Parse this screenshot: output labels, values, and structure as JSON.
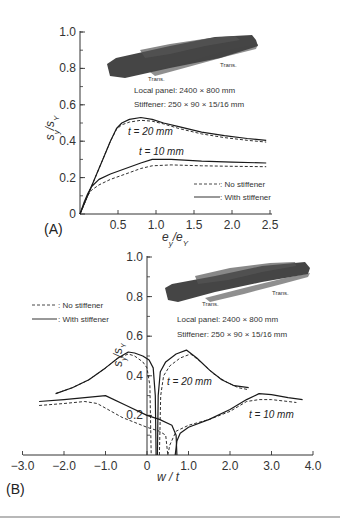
{
  "chart_data": [
    {
      "panel": "(A)",
      "type": "line",
      "title": "",
      "xlabel": "e_y/e_Y",
      "ylabel": "s_y/s_Y",
      "xlim": [
        0,
        2.5
      ],
      "ylim": [
        0,
        1.0
      ],
      "xticks": [
        "0.5",
        "1.0",
        "1.5",
        "2.0",
        "2.5"
      ],
      "yticks": [
        "0",
        "0.2",
        "0.4",
        "0.6",
        "0.8",
        "1.0"
      ],
      "annotations": [
        "Local panel: 2400 × 800 mm",
        "Stiffener: 250 × 90 × 15/16 mm",
        "Trans.",
        "Trans."
      ],
      "legend": [
        "No stiffener",
        "With stiffener"
      ],
      "series": [
        {
          "name": "t=20mm With stiffener",
          "style": "solid",
          "x": [
            0,
            0.1,
            0.2,
            0.3,
            0.4,
            0.48,
            0.55,
            0.65,
            0.8,
            0.95,
            1.1,
            1.3,
            1.6,
            1.9,
            2.2,
            2.45
          ],
          "y": [
            0,
            0.1,
            0.2,
            0.3,
            0.4,
            0.47,
            0.5,
            0.52,
            0.53,
            0.52,
            0.5,
            0.48,
            0.45,
            0.43,
            0.415,
            0.405
          ]
        },
        {
          "name": "t=20mm No stiffener",
          "style": "dashed",
          "x": [
            0,
            0.1,
            0.2,
            0.3,
            0.4,
            0.48,
            0.55,
            0.65,
            0.8,
            0.95,
            1.1,
            1.3,
            1.6,
            1.9,
            2.2,
            2.45
          ],
          "y": [
            0,
            0.1,
            0.2,
            0.3,
            0.4,
            0.465,
            0.49,
            0.505,
            0.515,
            0.51,
            0.495,
            0.47,
            0.44,
            0.42,
            0.405,
            0.395
          ]
        },
        {
          "name": "t=10mm With stiffener",
          "style": "solid",
          "x": [
            0,
            0.05,
            0.1,
            0.15,
            0.25,
            0.4,
            0.6,
            0.8,
            0.95,
            1.2,
            1.6,
            2.0,
            2.45
          ],
          "y": [
            0,
            0.06,
            0.11,
            0.15,
            0.19,
            0.22,
            0.25,
            0.28,
            0.3,
            0.3,
            0.29,
            0.285,
            0.28
          ]
        },
        {
          "name": "t=10mm No stiffener",
          "style": "dashed",
          "x": [
            0,
            0.05,
            0.1,
            0.15,
            0.25,
            0.4,
            0.6,
            0.8,
            0.95,
            1.2,
            1.6,
            2.0,
            2.45
          ],
          "y": [
            0,
            0.05,
            0.1,
            0.13,
            0.16,
            0.19,
            0.22,
            0.25,
            0.265,
            0.27,
            0.265,
            0.262,
            0.26
          ]
        }
      ],
      "curve_labels": [
        "t = 20 mm",
        "t = 10 mm"
      ]
    },
    {
      "panel": "(B)",
      "type": "line",
      "title": "",
      "xlabel": "w/t",
      "ylabel": "s_y/s_Y",
      "xlim": [
        -3.0,
        4.0
      ],
      "ylim": [
        0,
        1.0
      ],
      "xticks": [
        "-3.0",
        "-2.0",
        "-1.0",
        "0",
        "1.0",
        "2.0",
        "3.0",
        "4.0"
      ],
      "yticks": [
        "0.2",
        "0.4",
        "0.6",
        "0.8",
        "1.0"
      ],
      "annotations": [
        "Local panel: 2400 × 800 mm",
        "Stiffener: 250 × 90 × 15/16 mm",
        "Trans.",
        "Trans."
      ],
      "legend": [
        "No stiffener",
        "With stiffener"
      ],
      "series": [
        {
          "name": "t=20mm With stiffener (left)",
          "style": "solid",
          "x": [
            -2.2,
            -1.8,
            -1.4,
            -1.0,
            -0.7,
            -0.45,
            -0.3,
            -0.1,
            0.05,
            0.15,
            0.2,
            0.22
          ],
          "y": [
            0.31,
            0.34,
            0.38,
            0.44,
            0.49,
            0.52,
            0.515,
            0.5,
            0.48,
            0.44,
            0.3,
            0.0
          ]
        },
        {
          "name": "t=20mm No stiffener (left)",
          "style": "dashed",
          "x": [
            -2.2,
            -1.8,
            -1.4,
            -1.0,
            -0.7,
            -0.45,
            -0.3,
            -0.1,
            0.0,
            0.07,
            0.1
          ],
          "y": [
            0.31,
            0.34,
            0.38,
            0.44,
            0.49,
            0.51,
            0.5,
            0.47,
            0.44,
            0.35,
            0.0
          ]
        },
        {
          "name": "t=20mm With stiffener (right)",
          "style": "solid",
          "x": [
            0.25,
            0.27,
            0.32,
            0.45,
            0.7,
            0.95,
            1.2,
            1.5,
            1.8,
            2.1,
            2.45
          ],
          "y": [
            0.0,
            0.3,
            0.42,
            0.47,
            0.51,
            0.53,
            0.49,
            0.43,
            0.38,
            0.35,
            0.34
          ]
        },
        {
          "name": "t=20mm No stiffener (right)",
          "style": "dashed",
          "x": [
            0.3,
            0.33,
            0.4,
            0.55,
            0.8,
            1.05,
            1.3,
            1.6,
            1.9,
            2.2,
            2.45
          ],
          "y": [
            0.0,
            0.3,
            0.4,
            0.45,
            0.49,
            0.51,
            0.47,
            0.41,
            0.37,
            0.34,
            0.33
          ]
        },
        {
          "name": "t=10mm With stiffener",
          "style": "solid",
          "x": [
            -2.6,
            -2.0,
            -1.5,
            -1.0,
            -0.5,
            0.0,
            0.3,
            0.6,
            0.7,
            0.72
          ],
          "y": [
            0.27,
            0.28,
            0.29,
            0.3,
            0.25,
            0.2,
            0.18,
            0.15,
            0.1,
            0.0
          ]
        },
        {
          "name": "t=10mm No stiffener",
          "style": "dashed",
          "x": [
            -2.6,
            -2.0,
            -1.5,
            -1.2,
            -0.6,
            0.0,
            0.3,
            0.45,
            0.5
          ],
          "y": [
            0.25,
            0.26,
            0.27,
            0.26,
            0.19,
            0.14,
            0.12,
            0.1,
            0.0
          ]
        },
        {
          "name": "t=10mm With stiffener (right)",
          "style": "solid",
          "x": [
            0.68,
            0.72,
            0.8,
            1.0,
            1.5,
            2.0,
            2.4,
            2.7,
            3.0,
            3.4,
            3.75
          ],
          "y": [
            0.0,
            0.07,
            0.11,
            0.14,
            0.18,
            0.23,
            0.28,
            0.31,
            0.305,
            0.29,
            0.28
          ]
        },
        {
          "name": "t=10mm No stiffener (right)",
          "style": "dashed",
          "x": [
            0.5,
            0.55,
            0.7,
            1.0,
            1.5,
            2.0,
            2.4,
            2.7,
            3.0,
            3.4,
            3.6
          ],
          "y": [
            0.0,
            0.05,
            0.12,
            0.15,
            0.18,
            0.22,
            0.27,
            0.28,
            0.28,
            0.27,
            0.265
          ]
        }
      ],
      "curve_labels": [
        "t = 20 mm",
        "t = 10 mm"
      ]
    }
  ],
  "panelA": {
    "label": "(A)",
    "xlabel": "e",
    "xlabel_sub1": "y",
    "xlabel_sep": "/e",
    "xlabel_sub2": "Y",
    "ylabel": "s",
    "ylabel_sub1": "y",
    "ylabel_sep": "/s",
    "ylabel_sub2": "Y",
    "yticks": [
      "0",
      "0.2",
      "0.4",
      "0.6",
      "0.8",
      "1.0"
    ],
    "xticks": [
      "0.5",
      "1.0",
      "1.5",
      "2.0",
      "2.5"
    ],
    "annot_panel": "Local panel: 2400 × 800 mm",
    "annot_stiffener": "Stiffener: 250 × 90 × 15/16 mm",
    "trans_left": "Trans.",
    "trans_right": "Trans.",
    "label_t20": "t = 20 mm",
    "label_t10": "t = 10 mm",
    "legend_dashed": ": No stiffener",
    "legend_solid": ": With stiffener"
  },
  "panelB": {
    "label": "(B)",
    "xlabel": "w / t",
    "ylabel": "s",
    "ylabel_sub1": "y",
    "ylabel_sep": "/s",
    "ylabel_sub2": "Y",
    "yticks": [
      "0.2",
      "0.4",
      "0.6",
      "0.8",
      "1.0"
    ],
    "xticks": [
      "−3.0",
      "−2.0",
      "−1.0",
      "0",
      "1.0",
      "2.0",
      "3.0",
      "4.0"
    ],
    "annot_panel": "Local panel: 2400 × 800 mm",
    "annot_stiffener": "Stiffener: 250 × 90 × 15/16 mm",
    "trans_left": "Trans.",
    "trans_right": "Trans.",
    "label_t20": "t = 20 mm",
    "label_t10": "t = 10 mm",
    "legend_dashed": ": No stiffener",
    "legend_solid": ": With stiffener"
  },
  "colors": {
    "line": "#1a1a1a",
    "mesh": "#2a2a2a",
    "axis": "#333333"
  }
}
